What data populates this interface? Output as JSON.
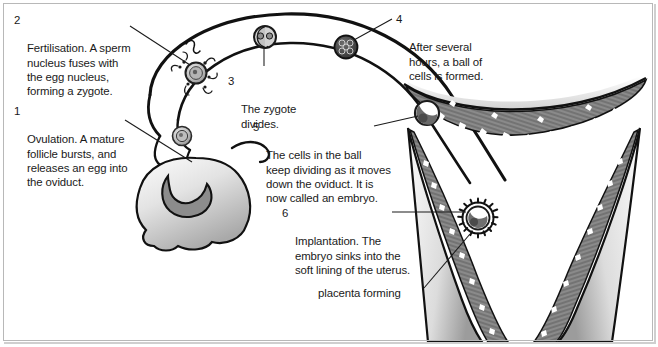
{
  "figure": {
    "background_color": "#ffffff",
    "border_color": "#b8b8b8",
    "ink_color": "#1a1a1a"
  },
  "callouts": [
    {
      "id": "callout-1",
      "number": "1",
      "text": "Ovulation. A mature\nfollicle bursts, and\nreleases an egg into\nthe oviduct.",
      "x": 14,
      "y": 104
    },
    {
      "id": "callout-2",
      "number": "2",
      "text": "Fertilisation. A sperm\nnucleus fuses with\nthe egg nucleus,\nforming a zygote.",
      "x": 14,
      "y": 13
    },
    {
      "id": "callout-3",
      "number": "3",
      "text": "The zygote\ndivides.",
      "x": 228,
      "y": 74
    },
    {
      "id": "callout-4",
      "number": "4",
      "text": "After several\nhours, a ball of\ncells is formed.",
      "x": 396,
      "y": 12
    },
    {
      "id": "callout-5",
      "number": "5",
      "text": "The cells in the ball\nkeep dividing as it moves\ndown the oviduct. It is\nnow called an embryo.",
      "x": 253,
      "y": 120
    },
    {
      "id": "callout-6",
      "number": "6",
      "text": "Implantation. The\nembryo sinks into the\nsoft lining of the uterus.",
      "x": 282,
      "y": 206
    }
  ],
  "plain_labels": [
    {
      "id": "label-placenta-forming",
      "text": "placenta forming",
      "x": 318,
      "y": 286
    }
  ],
  "structures": [
    {
      "name": "oviduct",
      "description": "fallopian tube arching from ovary to uterus"
    },
    {
      "name": "ovary",
      "description": "lobed gland at lower left with crescent follicle"
    },
    {
      "name": "ruptured-follicle",
      "description": "crescent shaped burst follicle on ovary"
    },
    {
      "name": "released-egg",
      "description": "ovum released into oviduct"
    },
    {
      "name": "fertilised-egg-with-sperm",
      "description": "egg surrounded by sperm cells"
    },
    {
      "name": "two-cell-zygote",
      "description": "zygote divided into two cells"
    },
    {
      "name": "morula",
      "description": "ball of cells"
    },
    {
      "name": "blastocyst",
      "description": "hollow ball of cells entering uterus"
    },
    {
      "name": "implanted-embryo",
      "description": "embryo embedded in uterus lining"
    },
    {
      "name": "uterus",
      "description": "uterus with thick endometrial lining"
    },
    {
      "name": "endometrium",
      "description": "soft lining of the uterus"
    }
  ],
  "leader_lines": [
    {
      "from": "callout-1",
      "to": "ruptured-follicle"
    },
    {
      "from": "callout-2",
      "to": "fertilised-egg-with-sperm"
    },
    {
      "from": "callout-3",
      "to": "two-cell-zygote"
    },
    {
      "from": "callout-4",
      "to": "morula"
    },
    {
      "from": "callout-5",
      "to": "blastocyst"
    },
    {
      "from": "callout-6",
      "to": "implanted-embryo"
    },
    {
      "from": "label-placenta-forming",
      "to": "implanted-embryo"
    }
  ]
}
